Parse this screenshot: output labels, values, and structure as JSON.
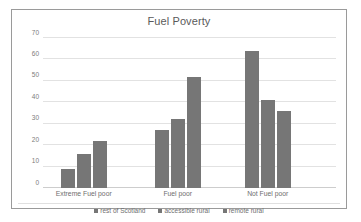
{
  "chart_data": {
    "type": "bar",
    "title": "Fuel Poverty",
    "xlabel": "",
    "ylabel": "",
    "ylim": [
      0,
      70
    ],
    "yticks": [
      0,
      10,
      20,
      30,
      40,
      50,
      60,
      70
    ],
    "grid": true,
    "legend_position": "bottom",
    "categories": [
      "Extreme Fuel poor",
      "Fuel poor",
      "Not Fuel poor"
    ],
    "series": [
      {
        "name": "rest of Scotland",
        "values": [
          9,
          27,
          64
        ],
        "color": "#767676"
      },
      {
        "name": "accessible rural",
        "values": [
          16,
          32,
          41
        ],
        "color": "#767676"
      },
      {
        "name": "remote rural",
        "values": [
          22,
          52,
          36
        ],
        "color": "#767676"
      }
    ]
  },
  "style": {
    "bar_color": "#767676",
    "grid_color": "#e2e2e2",
    "axis_color": "#cdcdcd",
    "frame_color": "#9a9a9a",
    "title_color": "#5a5a5a",
    "label_color": "#6e6e6e",
    "background": "#ffffff"
  }
}
